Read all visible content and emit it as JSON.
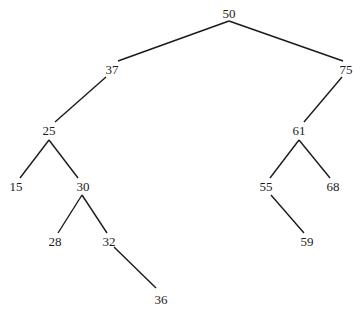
{
  "diagram": {
    "type": "binary-search-tree",
    "nodes": [
      {
        "id": "n50",
        "label": "50",
        "x": 229,
        "y": 14
      },
      {
        "id": "n37",
        "label": "37",
        "x": 112,
        "y": 70
      },
      {
        "id": "n75",
        "label": "75",
        "x": 346,
        "y": 70
      },
      {
        "id": "n25",
        "label": "25",
        "x": 49,
        "y": 131
      },
      {
        "id": "n61",
        "label": "61",
        "x": 299,
        "y": 131
      },
      {
        "id": "n15",
        "label": "15",
        "x": 16,
        "y": 187
      },
      {
        "id": "n30",
        "label": "30",
        "x": 83,
        "y": 187
      },
      {
        "id": "n55",
        "label": "55",
        "x": 266,
        "y": 187
      },
      {
        "id": "n68",
        "label": "68",
        "x": 333,
        "y": 187
      },
      {
        "id": "n28",
        "label": "28",
        "x": 55,
        "y": 242
      },
      {
        "id": "n32",
        "label": "32",
        "x": 109,
        "y": 242
      },
      {
        "id": "n59",
        "label": "59",
        "x": 307,
        "y": 242
      },
      {
        "id": "n36",
        "label": "36",
        "x": 161,
        "y": 300
      }
    ],
    "edges": [
      {
        "from": "n50",
        "to": "n37",
        "x1": 229,
        "y1": 21,
        "x2": 118,
        "y2": 61
      },
      {
        "from": "n50",
        "to": "n75",
        "x1": 229,
        "y1": 21,
        "x2": 343,
        "y2": 61
      },
      {
        "from": "n37",
        "to": "n25",
        "x1": 106,
        "y1": 77,
        "x2": 55,
        "y2": 122
      },
      {
        "from": "n75",
        "to": "n61",
        "x1": 342,
        "y1": 77,
        "x2": 304,
        "y2": 122
      },
      {
        "from": "n25",
        "to": "n15",
        "x1": 49,
        "y1": 140,
        "x2": 20,
        "y2": 178
      },
      {
        "from": "n25",
        "to": "n30",
        "x1": 49,
        "y1": 140,
        "x2": 78,
        "y2": 178
      },
      {
        "from": "n61",
        "to": "n55",
        "x1": 299,
        "y1": 140,
        "x2": 270,
        "y2": 178
      },
      {
        "from": "n61",
        "to": "n68",
        "x1": 299,
        "y1": 140,
        "x2": 330,
        "y2": 178
      },
      {
        "from": "n30",
        "to": "n28",
        "x1": 82,
        "y1": 195,
        "x2": 58,
        "y2": 233
      },
      {
        "from": "n30",
        "to": "n32",
        "x1": 82,
        "y1": 195,
        "x2": 107,
        "y2": 233
      },
      {
        "from": "n55",
        "to": "n59",
        "x1": 271,
        "y1": 195,
        "x2": 304,
        "y2": 233
      },
      {
        "from": "n32",
        "to": "n36",
        "x1": 114,
        "y1": 247,
        "x2": 156,
        "y2": 288
      }
    ]
  }
}
